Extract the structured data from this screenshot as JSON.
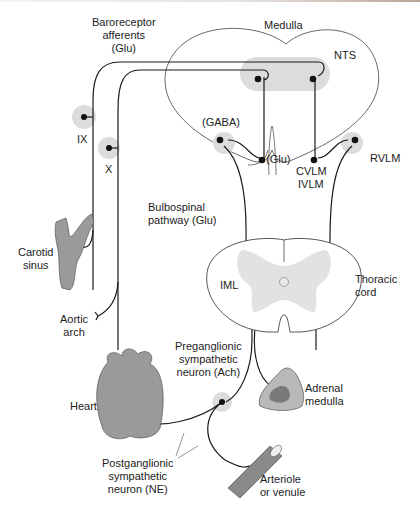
{
  "figure": {
    "labels": {
      "baroreceptor_afferents": [
        "Baroreceptor",
        "afferents",
        "(Glu)"
      ],
      "medulla": "Medulla",
      "nts": "NTS",
      "ix": "IX",
      "x": "X",
      "gaba": "(GABA)",
      "glu": "(Glu)",
      "cvlm": "CVLM",
      "ivlm": "IVLM",
      "rvlm": "RVLM",
      "bulbospinal": [
        "Bulbospinal",
        "pathway (Glu)"
      ],
      "carotid_sinus": [
        "Carotid",
        "sinus"
      ],
      "iml": "IML",
      "thoracic_cord": [
        "Thoracic",
        "cord"
      ],
      "aortic_arch": [
        "Aortic",
        "arch"
      ],
      "preganglionic": [
        "Preganglionic",
        "sympathetic",
        "neuron (Ach)"
      ],
      "heart": "Heart",
      "adrenal_medulla": [
        "Adrenal",
        "medulla"
      ],
      "postganglionic": [
        "Postganglionic",
        "sympathetic",
        "neuron (NE)"
      ],
      "arteriole": [
        "Arteriole",
        "or venule"
      ]
    },
    "colors": {
      "line": "#1a1a1a",
      "nucleus_shade": "#dcdcdc",
      "organ_fill": "#9a9a9a",
      "organ_dark": "#6e6e6e",
      "grey_matter": "#e2e2e2"
    }
  }
}
